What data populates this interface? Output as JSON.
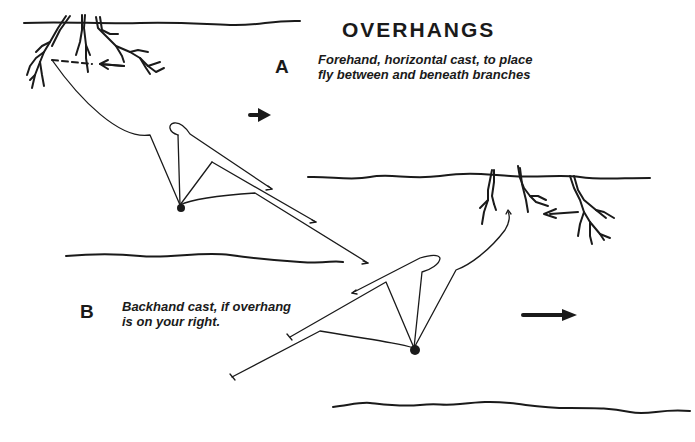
{
  "diagram": {
    "title": "OVERHANGS",
    "sections": [
      {
        "letter": "A",
        "caption_lines": [
          "Forehand, horizontal cast, to place",
          "fly between and beneath branches"
        ]
      },
      {
        "letter": "B",
        "caption_lines": [
          "Backhand cast, if overhang",
          "is on your right."
        ]
      }
    ],
    "elements": {
      "bank_top_left": "top-left-bank-with-overhanging-branches",
      "bank_right": "right-bank-with-overhanging-branches",
      "water_lines": 2,
      "current_arrows": [
        "flow-arrow-right-A",
        "flow-arrow-right-B"
      ],
      "angler_positions": [
        "angler-A",
        "angler-B"
      ]
    },
    "colors": {
      "ink": "#1a1a1a",
      "background": "#ffffff"
    }
  }
}
